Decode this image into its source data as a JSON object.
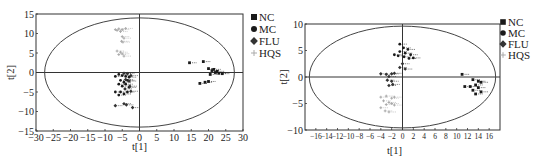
{
  "chart_data": [
    {
      "type": "scatter",
      "title": "",
      "xlabel": "t[1]",
      "ylabel": "t[2]",
      "xlim": [
        -30,
        30
      ],
      "ylim": [
        -15,
        15
      ],
      "xticks": [
        -30,
        -25,
        -20,
        -15,
        -10,
        -5,
        0,
        5,
        10,
        15,
        20,
        25,
        30
      ],
      "yticks": [
        -15,
        -10,
        -5,
        0,
        5,
        10,
        15
      ],
      "grid": false,
      "legend_position": "right",
      "ellipse": {
        "cx": 0,
        "cy": 0,
        "rx": 27.5,
        "ry": 14
      },
      "series": [
        {
          "name": "NC",
          "marker": "square",
          "color": "#1a1a1a",
          "points": [
            [
              14.5,
              2.5
            ],
            [
              18.5,
              2.8
            ],
            [
              20,
              1
            ],
            [
              21,
              0.5
            ],
            [
              21.5,
              0.8
            ],
            [
              22,
              0
            ],
            [
              23,
              -0.2
            ],
            [
              24,
              -0.3
            ],
            [
              20.5,
              -0.5
            ],
            [
              22.5,
              0.3
            ],
            [
              17.5,
              -2.8
            ],
            [
              19,
              -2.5
            ],
            [
              20,
              -2.3
            ]
          ]
        },
        {
          "name": "MC",
          "marker": "circle",
          "color": "#1a1a1a",
          "points": [
            [
              -7,
              -1
            ],
            [
              -6,
              -0.5
            ],
            [
              -5,
              -0.8
            ],
            [
              -4,
              -1
            ],
            [
              -3,
              -1.2
            ],
            [
              -5.5,
              -2
            ],
            [
              -4.5,
              -2.5
            ],
            [
              -3.5,
              -2
            ],
            [
              -6,
              -3
            ],
            [
              -5,
              -3.5
            ],
            [
              -4,
              -3
            ],
            [
              -3,
              -3.8
            ],
            [
              -7,
              -5
            ],
            [
              -5.5,
              -5
            ],
            [
              -4.5,
              -5.5
            ],
            [
              -3.5,
              -5
            ],
            [
              -6,
              -5.8
            ]
          ]
        },
        {
          "name": "FLU",
          "marker": "diamond",
          "color": "#333333",
          "points": [
            [
              -4.5,
              -0.2
            ],
            [
              -3.5,
              -0.3
            ],
            [
              -2.5,
              -0.8
            ],
            [
              -4,
              -1.8
            ],
            [
              -3,
              -2.2
            ],
            [
              -2.8,
              -3.5
            ],
            [
              -4.2,
              -4.2
            ],
            [
              -2.5,
              -4.8
            ],
            [
              -7,
              -8.5
            ],
            [
              -4.5,
              -8
            ],
            [
              -3.8,
              -8.3
            ],
            [
              -2,
              -9
            ]
          ]
        },
        {
          "name": "HQS",
          "marker": "cross",
          "color": "#aaaaaa",
          "points": [
            [
              -7,
              11
            ],
            [
              -6,
              11.2
            ],
            [
              -5,
              11
            ],
            [
              -4,
              11.3
            ],
            [
              -6.5,
              10.8
            ],
            [
              -5.5,
              10.5
            ],
            [
              -5,
              9.2
            ],
            [
              -4.5,
              8.8
            ],
            [
              -5.2,
              8
            ],
            [
              -4.8,
              7.8
            ],
            [
              -6.5,
              5.5
            ],
            [
              -5.5,
              5.2
            ],
            [
              -6,
              4.6
            ],
            [
              -5,
              4.8
            ],
            [
              -4.5,
              4.2
            ]
          ]
        }
      ]
    },
    {
      "type": "scatter",
      "title": "",
      "xlabel": "t[1]",
      "ylabel": "t[2]",
      "xlim": [
        -18,
        18
      ],
      "ylim": [
        -10,
        10
      ],
      "xticks": [
        -16,
        -14,
        -12,
        -10,
        -8,
        -6,
        -4,
        -2,
        0,
        2,
        4,
        6,
        8,
        10,
        12,
        14,
        16
      ],
      "yticks": [
        -10,
        -5,
        0,
        5,
        10
      ],
      "grid": false,
      "legend_position": "right",
      "ellipse": {
        "cx": 0,
        "cy": 0,
        "rx": 17.2,
        "ry": 9.6
      },
      "series": [
        {
          "name": "NC",
          "marker": "square",
          "color": "#1a1a1a",
          "points": [
            [
              11,
              0.5
            ],
            [
              13,
              -0.5
            ],
            [
              14,
              -0.8
            ],
            [
              14.5,
              -1
            ],
            [
              13.5,
              -1.5
            ],
            [
              12.5,
              -1.8
            ],
            [
              11.5,
              -1.8
            ],
            [
              14,
              -2
            ],
            [
              13,
              -2.5
            ],
            [
              14.5,
              -2.8
            ],
            [
              13.5,
              -3.2
            ]
          ]
        },
        {
          "name": "MC",
          "marker": "circle",
          "color": "#1a1a1a",
          "points": [
            [
              -0.5,
              6.2
            ],
            [
              0.2,
              5.5
            ],
            [
              1,
              5.2
            ],
            [
              -0.5,
              4.8
            ],
            [
              0.5,
              4.5
            ],
            [
              1.5,
              4.2
            ],
            [
              -1.5,
              4.2
            ],
            [
              -0.8,
              4
            ],
            [
              0.3,
              3.8
            ],
            [
              1.2,
              3.5
            ],
            [
              2,
              3.6
            ]
          ]
        },
        {
          "name": "FLU",
          "marker": "diamond",
          "color": "#333333",
          "points": [
            [
              0,
              2.5
            ],
            [
              -0.5,
              1.8
            ],
            [
              0.5,
              1.5
            ],
            [
              -4,
              0.6
            ],
            [
              -3,
              0.5
            ],
            [
              -2,
              0.6
            ],
            [
              -1.5,
              0.7
            ],
            [
              -2.5,
              0.1
            ],
            [
              -2.8,
              -0.6
            ],
            [
              -2,
              -0.8
            ],
            [
              -1.8,
              -1.4
            ],
            [
              -2.5,
              -1.6
            ]
          ]
        },
        {
          "name": "HQS",
          "marker": "cross",
          "color": "#aaaaaa",
          "points": [
            [
              -4,
              -3.8
            ],
            [
              -3,
              -3.6
            ],
            [
              -2,
              -4
            ],
            [
              -1.5,
              -3.8
            ],
            [
              -3.5,
              -4.5
            ],
            [
              -2.5,
              -4.8
            ],
            [
              -2,
              -5
            ],
            [
              -3,
              -5.2
            ],
            [
              -1.5,
              -5.3
            ],
            [
              -3.2,
              -6.4
            ],
            [
              -2.5,
              -6.6
            ],
            [
              -4,
              -5.8
            ]
          ]
        }
      ]
    }
  ],
  "legend": [
    {
      "label": "NC"
    },
    {
      "label": "MC"
    },
    {
      "label": "FLU"
    },
    {
      "label": "HQS"
    }
  ]
}
